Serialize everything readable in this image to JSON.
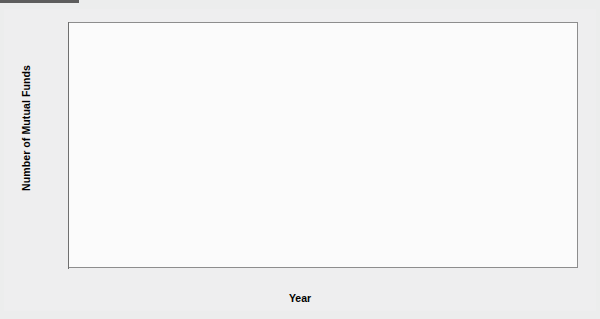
{
  "figure": {
    "background_color": "#eeeeef",
    "plot_background_color": "#fbfbfb",
    "bar_fill_color": "#c6c6c6",
    "bar_border_color": "#7c7c7c",
    "axis_color": "#6f6f6f",
    "top_rule_color": "#5d5d5d"
  },
  "chart_data": {
    "type": "bar",
    "title": "",
    "xlabel": "Year",
    "ylabel": "Number of Mutual Funds",
    "categories": [
      "1990",
      "1991",
      "1992",
      "1993",
      "1994",
      "1995",
      "1996",
      "1997",
      "1998",
      "1999",
      "2000",
      "2001",
      "2002",
      "2003"
    ],
    "values": [
      3080,
      3400,
      3850,
      4550,
      5330,
      5760,
      6250,
      6680,
      7310,
      7790,
      8170,
      8700,
      8510,
      8240
    ],
    "ylim": [
      0,
      10000
    ],
    "y_ticks": [
      0,
      2000,
      4000,
      6000,
      8000,
      10000
    ],
    "y_tick_labels": [
      "0",
      "2,000",
      "4,000",
      "6,000",
      "8,000",
      "10,000"
    ],
    "grid": false,
    "legend": null,
    "legend_position": "none"
  }
}
